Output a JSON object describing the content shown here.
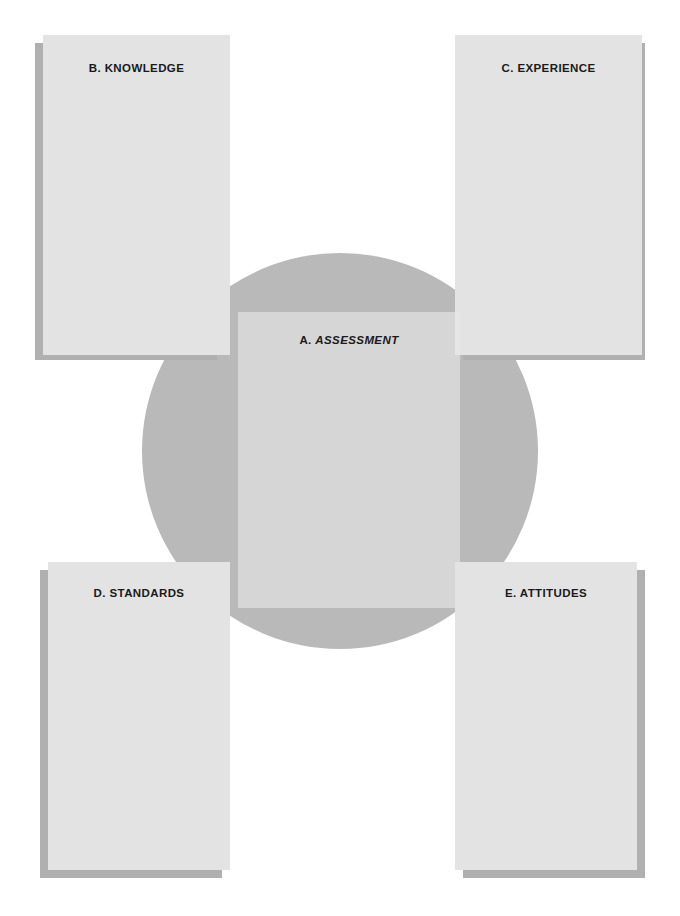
{
  "diagram": {
    "background_color": "#ffffff",
    "circle_color": "#b9b9b9",
    "card_color": "#e3e3e3",
    "shadow_color": "#b0b0b0",
    "label_color": "#1a1a1a"
  },
  "center": {
    "prefix": "A.",
    "name": "ASSESSMENT",
    "name_style": "italic"
  },
  "cards": [
    {
      "id": "knowledge",
      "prefix": "B.",
      "name": "KNOWLEDGE",
      "position": "top-left"
    },
    {
      "id": "experience",
      "prefix": "C.",
      "name": "EXPERIENCE",
      "position": "top-right"
    },
    {
      "id": "standards",
      "prefix": "D.",
      "name": "STANDARDS",
      "position": "bottom-left"
    },
    {
      "id": "attitudes",
      "prefix": "E.",
      "name": "ATTITUDES",
      "position": "bottom-right"
    }
  ]
}
